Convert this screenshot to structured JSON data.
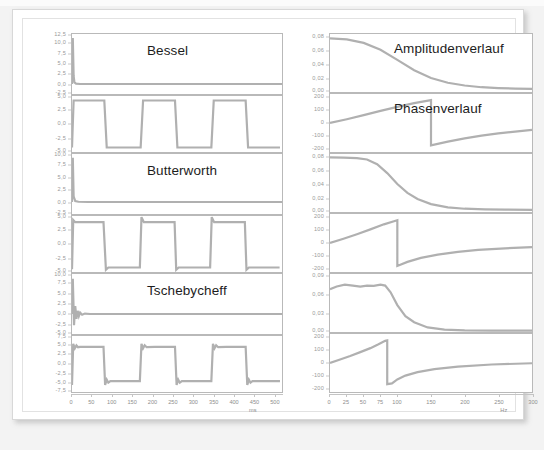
{
  "document": {
    "kind": "filter-response-figure",
    "page_background": "#f3f3f3",
    "card_background": "#ffffff",
    "trace_color": "#b0b0b0",
    "axis_color": "#b9b9b9",
    "tick_label_color": "#8e8e8e"
  },
  "left_column": {
    "x_axis": {
      "label": "ms",
      "ticks": [
        "0",
        "50",
        "100",
        "150",
        "200",
        "250",
        "300",
        "350",
        "400",
        "450",
        "500"
      ],
      "min": 0,
      "max": 520
    },
    "plots": [
      {
        "name": "bessel-input",
        "title": "Bessel",
        "y_ticks": [
          "12,5",
          "10,0",
          "7,5",
          "5,0",
          "2,5",
          "0,0",
          "-2,5"
        ],
        "y_min": -2.5,
        "y_max": 12.5,
        "signal": "impulse-decay"
      },
      {
        "name": "bessel-output",
        "title": "",
        "y_ticks": [
          "5,0",
          "2,5",
          "0,0",
          "-2,5",
          "-5,0"
        ],
        "y_min": -5.0,
        "y_max": 5.0,
        "signal": "square-clean"
      },
      {
        "name": "butterworth-input",
        "title": "Butterworth",
        "y_ticks": [
          "10,0",
          "7,5",
          "5,0",
          "2,5",
          "0,0",
          "-2,5"
        ],
        "y_min": -2.5,
        "y_max": 10.0,
        "signal": "impulse-decay"
      },
      {
        "name": "butterworth-output",
        "title": "",
        "y_ticks": [
          "5,0",
          "2,5",
          "0,0",
          "-2,5",
          "-5,0"
        ],
        "y_min": -5.0,
        "y_max": 5.0,
        "signal": "square-overshoot"
      },
      {
        "name": "tschebycheff-input",
        "title": "Tschebycheff",
        "y_ticks": [
          "10,0",
          "7,5",
          "5,0",
          "2,5",
          "0,0",
          "-2,5",
          "-5,0"
        ],
        "y_min": -5.0,
        "y_max": 10.0,
        "signal": "impulse-ringing"
      },
      {
        "name": "tschebycheff-output",
        "title": "",
        "y_ticks": [
          "7,5",
          "5,0",
          "2,5",
          "0,0",
          "-2,5",
          "-5,0",
          "-7,5"
        ],
        "y_min": -7.5,
        "y_max": 7.5,
        "signal": "square-ringing"
      }
    ]
  },
  "right_column": {
    "x_axis": {
      "label": "Hz",
      "ticks": [
        "0",
        "25",
        "50",
        "75",
        "100",
        "150",
        "200",
        "250",
        "300"
      ],
      "tick_values": [
        0,
        25,
        50,
        75,
        100,
        150,
        200,
        250,
        300
      ],
      "min": 0,
      "max": 300
    },
    "plots": [
      {
        "name": "bessel-amplitude",
        "title": "Amplitudenverlauf",
        "y_ticks": [
          "0,08",
          "0,06",
          "0,04",
          "0,02",
          "0,00"
        ],
        "y_min": 0.0,
        "y_max": 0.085,
        "signal": "amplitude-bessel"
      },
      {
        "name": "bessel-phase",
        "title": "Phasenverlauf",
        "y_ticks": [
          "200",
          "100",
          "0",
          "-100",
          "-200"
        ],
        "y_min": -230,
        "y_max": 230,
        "signal": "phase-bessel"
      },
      {
        "name": "butterworth-amplitude",
        "title": "",
        "y_ticks": [
          "0,08",
          "0,06",
          "0,04",
          "0,02",
          "0,00"
        ],
        "y_min": 0.0,
        "y_max": 0.085,
        "signal": "amplitude-butterworth"
      },
      {
        "name": "butterworth-phase",
        "title": "",
        "y_ticks": [
          "200",
          "100",
          "0",
          "-100",
          "-200"
        ],
        "y_min": -230,
        "y_max": 230,
        "signal": "phase-butterworth"
      },
      {
        "name": "tschebycheff-amplitude",
        "title": "",
        "y_ticks": [
          "0,09",
          "0,06",
          "0,03",
          "0,00"
        ],
        "y_min": 0.0,
        "y_max": 0.095,
        "signal": "amplitude-tschebycheff"
      },
      {
        "name": "tschebycheff-phase",
        "title": "",
        "y_ticks": [
          "200",
          "100",
          "0",
          "-100",
          "-200"
        ],
        "y_min": -230,
        "y_max": 230,
        "signal": "phase-tschebycheff"
      }
    ]
  },
  "chart_data": {
    "type": "line",
    "panels": [
      {
        "name": "bessel-input",
        "title": "Bessel",
        "xlabel": "ms",
        "ylabel": "",
        "xlim": [
          0,
          520
        ],
        "ylim": [
          -2.5,
          12.5
        ],
        "yticks": [
          12.5,
          10.0,
          7.5,
          5.0,
          2.5,
          0.0,
          -2.5
        ],
        "series": [
          {
            "name": "input-impulse",
            "x": [
              0,
              2,
              4,
              6,
              10,
              20,
              60,
              120,
              260,
              400,
              520
            ],
            "y": [
              0.0,
              11.5,
              2.0,
              0.4,
              0.1,
              0.0,
              0.0,
              0.0,
              0.0,
              0.0,
              0.0
            ]
          }
        ]
      },
      {
        "name": "bessel-output",
        "title": "",
        "xlabel": "ms",
        "ylabel": "",
        "xlim": [
          0,
          520
        ],
        "ylim": [
          -5.0,
          5.0
        ],
        "yticks": [
          5.0,
          2.5,
          0.0,
          -2.5,
          -5.0
        ],
        "series": [
          {
            "name": "square-clean",
            "x": [
              0,
              4,
              80,
              86,
              170,
              176,
              255,
              261,
              345,
              351,
              430,
              436,
              515
            ],
            "y": [
              -4.2,
              4.2,
              4.2,
              -4.2,
              -4.2,
              4.2,
              4.2,
              -4.2,
              -4.2,
              4.2,
              4.2,
              -4.2,
              -4.2
            ]
          }
        ]
      },
      {
        "name": "butterworth-input",
        "title": "Butterworth",
        "xlabel": "ms",
        "ylabel": "",
        "xlim": [
          0,
          520
        ],
        "ylim": [
          -2.5,
          10.0
        ],
        "yticks": [
          10.0,
          7.5,
          5.0,
          2.5,
          0.0,
          -2.5
        ],
        "series": [
          {
            "name": "input-impulse",
            "x": [
              0,
              2,
              4,
              8,
              16,
              40,
              120,
              300,
              520
            ],
            "y": [
              0.0,
              9.2,
              1.2,
              0.2,
              0.05,
              0.0,
              0.0,
              0.0,
              0.0
            ]
          }
        ]
      },
      {
        "name": "butterworth-output",
        "title": "",
        "xlabel": "ms",
        "ylabel": "",
        "xlim": [
          0,
          520
        ],
        "ylim": [
          -5.0,
          5.0
        ],
        "yticks": [
          5.0,
          2.5,
          0.0,
          -2.5,
          -5.0
        ],
        "series": [
          {
            "name": "square-overshoot",
            "x": [
              0,
              3,
              8,
              78,
              84,
              90,
              168,
              172,
              178,
              254,
              258,
              264,
              342,
              346,
              352,
              428,
              432,
              438,
              514
            ],
            "y": [
              -4.5,
              4.3,
              3.9,
              3.9,
              -4.6,
              -4.2,
              -4.2,
              4.8,
              3.9,
              3.9,
              -4.6,
              -4.2,
              -4.2,
              4.8,
              3.9,
              3.9,
              -4.6,
              -4.2,
              -4.2
            ]
          }
        ]
      },
      {
        "name": "tschebycheff-input",
        "title": "Tschebycheff",
        "xlabel": "ms",
        "ylabel": "",
        "xlim": [
          0,
          520
        ],
        "ylim": [
          -5.0,
          10.0
        ],
        "yticks": [
          10.0,
          7.5,
          5.0,
          2.5,
          0.0,
          -2.5,
          -5.0
        ],
        "series": [
          {
            "name": "input-impulse-ringing",
            "x": [
              0,
              2,
              5,
              8,
              11,
              14,
              17,
              20,
              25,
              32,
              45,
              80,
              200,
              520
            ],
            "y": [
              0.0,
              8.8,
              -2.8,
              2.0,
              -1.2,
              0.8,
              -0.5,
              0.35,
              -0.2,
              0.1,
              0.0,
              0.0,
              0.0,
              0.0
            ]
          }
        ]
      },
      {
        "name": "tschebycheff-output",
        "title": "",
        "xlabel": "ms",
        "ylabel": "",
        "xlim": [
          0,
          520
        ],
        "ylim": [
          -7.5,
          7.5
        ],
        "yticks": [
          7.5,
          5.0,
          2.5,
          0.0,
          -2.5,
          -5.0,
          -7.5
        ],
        "series": [
          {
            "name": "square-ringing",
            "x": [
              0,
              3,
              7,
              11,
              15,
              20,
              40,
              78,
              82,
              86,
              90,
              95,
              115,
              168,
              172,
              176,
              180,
              185,
              205,
              255,
              259,
              263,
              267,
              272,
              292,
              345,
              349,
              353,
              357,
              362,
              382,
              430,
              434,
              438,
              442,
              447,
              467,
              515
            ],
            "y": [
              -5.6,
              5.4,
              4.2,
              5.0,
              4.5,
              4.6,
              4.6,
              4.6,
              -5.6,
              -4.2,
              -5.0,
              -4.6,
              -4.6,
              -4.6,
              5.4,
              4.2,
              5.0,
              4.5,
              4.6,
              4.6,
              -5.6,
              -4.2,
              -5.0,
              -4.6,
              -4.6,
              -4.6,
              5.4,
              4.2,
              5.0,
              4.5,
              4.6,
              4.6,
              -5.6,
              -4.2,
              -5.0,
              -4.6,
              -4.6,
              -4.6
            ]
          }
        ]
      },
      {
        "name": "bessel-amplitude",
        "title": "Amplitudenverlauf",
        "xlabel": "Hz",
        "ylabel": "",
        "xlim": [
          0,
          300
        ],
        "ylim": [
          0.0,
          0.085
        ],
        "yticks": [
          0.08,
          0.06,
          0.04,
          0.02,
          0.0
        ],
        "series": [
          {
            "name": "amplitude",
            "x": [
              0,
              25,
              50,
              75,
              100,
              125,
              150,
              175,
              200,
              225,
              250,
              275,
              300
            ],
            "y": [
              0.0785,
              0.077,
              0.072,
              0.062,
              0.047,
              0.032,
              0.0205,
              0.0135,
              0.0095,
              0.007,
              0.0058,
              0.005,
              0.0046
            ]
          }
        ]
      },
      {
        "name": "bessel-phase",
        "title": "Phasenverlauf",
        "xlabel": "Hz",
        "ylabel": "",
        "xlim": [
          0,
          300
        ],
        "ylim": [
          -230,
          230
        ],
        "yticks": [
          200,
          100,
          0,
          -100,
          -200
        ],
        "series": [
          {
            "name": "phase",
            "x": [
              0,
              25,
              50,
              75,
              100,
              125,
              150,
              150,
              175,
              200,
              225,
              250,
              275,
              300
            ],
            "y": [
              0,
              30,
              62,
              96,
              128,
              158,
              182,
              -178,
              -148,
              -122,
              -100,
              -82,
              -68,
              -55
            ]
          }
        ]
      },
      {
        "name": "butterworth-amplitude",
        "title": "",
        "xlabel": "Hz",
        "ylabel": "",
        "xlim": [
          0,
          300
        ],
        "ylim": [
          0.0,
          0.085
        ],
        "yticks": [
          0.08,
          0.06,
          0.04,
          0.02,
          0.0
        ],
        "series": [
          {
            "name": "amplitude",
            "x": [
              0,
              20,
              40,
              55,
              70,
              85,
              100,
              115,
              130,
              150,
              175,
              200,
              230,
              260,
              300
            ],
            "y": [
              0.08,
              0.0798,
              0.079,
              0.077,
              0.07,
              0.057,
              0.041,
              0.028,
              0.019,
              0.0115,
              0.0068,
              0.0048,
              0.0038,
              0.0034,
              0.0032
            ]
          }
        ]
      },
      {
        "name": "butterworth-phase",
        "title": "",
        "xlabel": "Hz",
        "ylabel": "",
        "xlim": [
          0,
          300
        ],
        "ylim": [
          -230,
          230
        ],
        "yticks": [
          200,
          100,
          0,
          -100,
          -200
        ],
        "series": [
          {
            "name": "phase",
            "x": [
              0,
              20,
              40,
              60,
              80,
              95,
              100,
              100,
              115,
              135,
              160,
              190,
              220,
              260,
              300
            ],
            "y": [
              0,
              34,
              70,
              108,
              148,
              172,
              180,
              -182,
              -150,
              -118,
              -92,
              -70,
              -55,
              -42,
              -32
            ]
          }
        ]
      },
      {
        "name": "tschebycheff-amplitude",
        "title": "",
        "xlabel": "Hz",
        "ylabel": "",
        "xlim": [
          0,
          300
        ],
        "ylim": [
          0.0,
          0.095
        ],
        "yticks": [
          0.09,
          0.06,
          0.03,
          0.0
        ],
        "series": [
          {
            "name": "amplitude",
            "x": [
              0,
              10,
              22,
              34,
              45,
              55,
              65,
              75,
              82,
              90,
              100,
              112,
              125,
              145,
              170,
              200,
              240,
              300
            ],
            "y": [
              0.07,
              0.0745,
              0.0775,
              0.076,
              0.0745,
              0.076,
              0.0755,
              0.0775,
              0.076,
              0.065,
              0.044,
              0.026,
              0.016,
              0.0075,
              0.004,
              0.0028,
              0.0024,
              0.0024
            ]
          }
        ]
      },
      {
        "name": "tschebycheff-phase",
        "title": "",
        "xlabel": "Hz",
        "ylabel": "",
        "xlim": [
          0,
          300
        ],
        "ylim": [
          -230,
          230
        ],
        "yticks": [
          200,
          100,
          0,
          -100,
          -200
        ],
        "series": [
          {
            "name": "phase",
            "x": [
              0,
              15,
              30,
              45,
              60,
              72,
              82,
              85,
              85,
              92,
              100,
              112,
              130,
              155,
              190,
              240,
              300
            ],
            "y": [
              0,
              28,
              56,
              86,
              118,
              148,
              176,
              180,
              -168,
              -162,
              -130,
              -100,
              -72,
              -48,
              -28,
              -12,
              -2
            ]
          }
        ]
      }
    ]
  }
}
